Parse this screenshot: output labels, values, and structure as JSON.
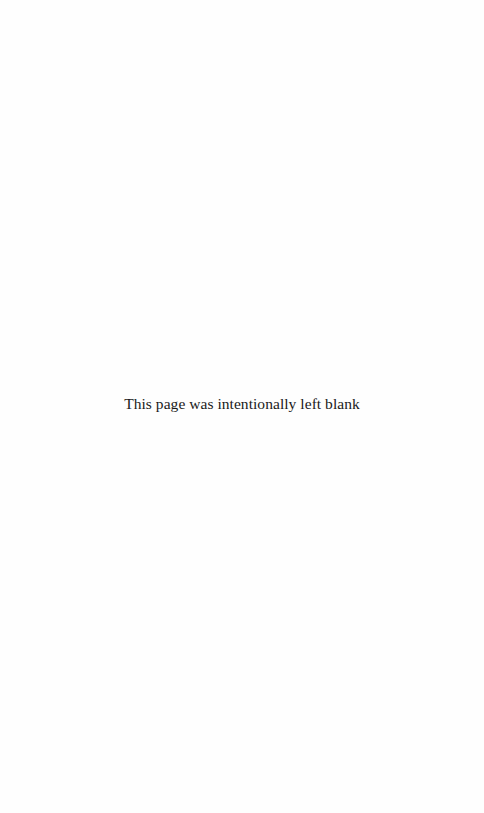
{
  "page": {
    "notice_text": "This page was intentionally left blank"
  }
}
